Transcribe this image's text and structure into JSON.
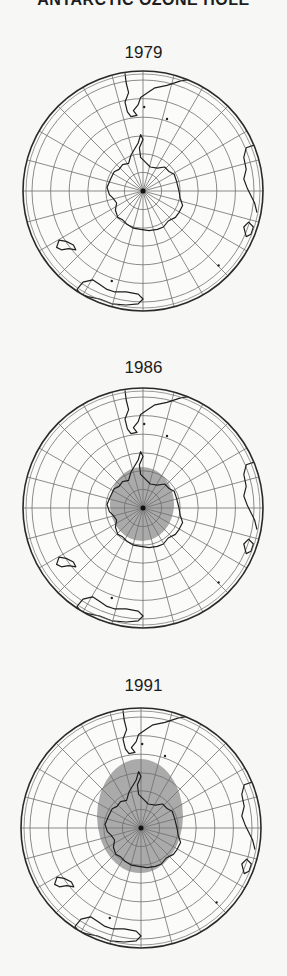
{
  "title": "ANTARCTIC OZONE HOLE",
  "colors": {
    "background": "#f7f7f6",
    "graticule": "#6e6e6e",
    "outline": "#2a2a2a",
    "coast": "#1f1f1f",
    "ozone_hole": "#9b9b9b"
  },
  "panels": [
    {
      "year": "1979",
      "label_top": 43,
      "globe": {
        "cx": 143,
        "cy": 191,
        "r": 120
      },
      "ozone_hole": null
    },
    {
      "year": "1986",
      "label_top": 358,
      "globe": {
        "cx": 143,
        "cy": 508,
        "r": 120
      },
      "ozone_hole": {
        "cx": 142,
        "cy": 504,
        "rx": 32,
        "ry": 37
      }
    },
    {
      "year": "1991",
      "label_top": 676,
      "globe": {
        "cx": 141,
        "cy": 828,
        "r": 120
      },
      "ozone_hole": {
        "cx": 140,
        "cy": 816,
        "rx": 43,
        "ry": 57
      }
    }
  ],
  "graticule": {
    "meridian_count": 24,
    "latitude_ring_fractions": [
      0.155,
      0.31,
      0.46,
      0.615,
      0.77,
      0.925
    ]
  }
}
